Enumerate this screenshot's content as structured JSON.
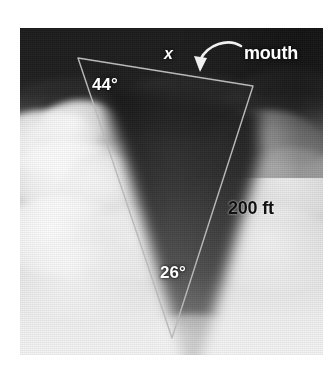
{
  "figure": {
    "photo": {
      "subject": "tornado-over-plains",
      "style": "grayscale-halftone",
      "frame": {
        "left": 20,
        "top": 28,
        "width": 303,
        "height": 327
      }
    },
    "overlay": {
      "shape": "triangle",
      "stroke_color": "#b9b9b9",
      "stroke_width": 1.4,
      "vertices": [
        {
          "name": "top-left",
          "x": 78,
          "y": 58
        },
        {
          "name": "top-right",
          "x": 253,
          "y": 86
        },
        {
          "name": "bottom",
          "x": 172,
          "y": 338
        }
      ],
      "arrow": {
        "name": "mouth-callout-arrow",
        "color": "#f2f2f2",
        "from": {
          "x": 243,
          "y": 47
        },
        "to": {
          "x": 198,
          "y": 72
        }
      }
    },
    "labels": {
      "unknown_side": "x",
      "callout": "mouth",
      "angle_top_left": "44°",
      "angle_bottom": "26°",
      "known_side": "200 ft"
    },
    "colors": {
      "background": "#ffffff",
      "overlay_line": "#b9b9b9",
      "white_label": "#ffffff",
      "black_label": "#111111",
      "storm_dark": "#1b1b1b",
      "cloud_light": "#f4f4f4"
    }
  }
}
